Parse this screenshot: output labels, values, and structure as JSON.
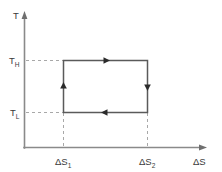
{
  "diagram": {
    "type": "thermodynamic-cycle",
    "background_color": "#ffffff",
    "line_color": "#5a5a5a",
    "axis_color": "#8a8a8a",
    "guide_color": "#a8a8a8",
    "arrow_color": "#2b2b2b",
    "axes": {
      "y": {
        "symbol": "T",
        "name": "temperature-axis",
        "direction": "up",
        "has_arrowhead": true
      },
      "x": {
        "symbol": "ΔS",
        "name": "entropy-axis",
        "direction": "right",
        "has_arrowhead": true
      }
    },
    "y_ticks": [
      {
        "base": "T",
        "sub": "H",
        "name": "t-high",
        "role": "hot reservoir temperature"
      },
      {
        "base": "T",
        "sub": "L",
        "name": "t-low",
        "role": "cold reservoir temperature"
      }
    ],
    "x_ticks": [
      {
        "base": "ΔS",
        "sub": "1",
        "name": "delta-s-1",
        "role": "entropy start"
      },
      {
        "base": "ΔS",
        "sub": "2",
        "name": "delta-s-2",
        "role": "entropy end"
      }
    ],
    "cycle": {
      "shape": "rectangle",
      "direction": "counterclockwise",
      "segments": [
        {
          "name": "isothermal-expansion-top",
          "from": "ΔS1,TH",
          "to": "ΔS2,TH",
          "arrow": "right"
        },
        {
          "name": "isentropic-cooling-right",
          "from": "ΔS2,TH",
          "to": "ΔS2,TL",
          "arrow": "down"
        },
        {
          "name": "isothermal-compression-bottom",
          "from": "ΔS2,TL",
          "to": "ΔS1,TL",
          "arrow": "left"
        },
        {
          "name": "isentropic-heating-left",
          "from": "ΔS1,TL",
          "to": "ΔS1,TH",
          "arrow": "up"
        }
      ]
    }
  }
}
